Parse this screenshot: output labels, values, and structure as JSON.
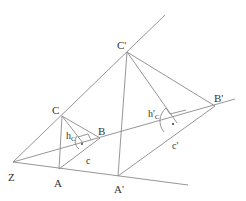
{
  "diagram": {
    "colors": {
      "line": "#8a8a8a",
      "text": "#333333",
      "background": "#ffffff"
    },
    "points": {
      "Z": {
        "label": "Z",
        "x": 13,
        "y": 162,
        "label_x": 8,
        "label_y": 181
      },
      "A": {
        "label": "A",
        "x": 59,
        "y": 169,
        "label_x": 54,
        "label_y": 187
      },
      "B": {
        "label": "B",
        "x": 100,
        "y": 138,
        "label_x": 98,
        "label_y": 135
      },
      "C": {
        "label": "C",
        "x": 62,
        "y": 116,
        "label_x": 52,
        "label_y": 114
      },
      "A'": {
        "label": "A'",
        "x": 118,
        "y": 176,
        "label_x": 114,
        "label_y": 193
      },
      "B'": {
        "label": "B'",
        "x": 215,
        "y": 106,
        "label_x": 214,
        "label_y": 102
      },
      "C'": {
        "label": "C'",
        "x": 127,
        "y": 52,
        "label_x": 117,
        "label_y": 49
      }
    },
    "segment_labels": {
      "h_c": {
        "main": "h",
        "sub": "C",
        "x": 66,
        "y": 139
      },
      "c": {
        "text": "c",
        "x": 86,
        "y": 164
      },
      "h'_c": {
        "main": "h'",
        "sub": "C",
        "x": 148,
        "y": 117
      },
      "c'": {
        "text": "c'",
        "x": 172,
        "y": 149
      }
    },
    "rays_from_Z": [
      {
        "through": "C",
        "end_x": 165,
        "end_y": 15
      },
      {
        "through": "A",
        "end_x": 188,
        "end_y": 185
      },
      {
        "through": "B",
        "end_x": 235,
        "end_y": 99
      }
    ],
    "feet": {
      "h_c": {
        "x": 83,
        "y": 143
      },
      "h'_c": {
        "x": 177,
        "y": 123
      }
    }
  }
}
